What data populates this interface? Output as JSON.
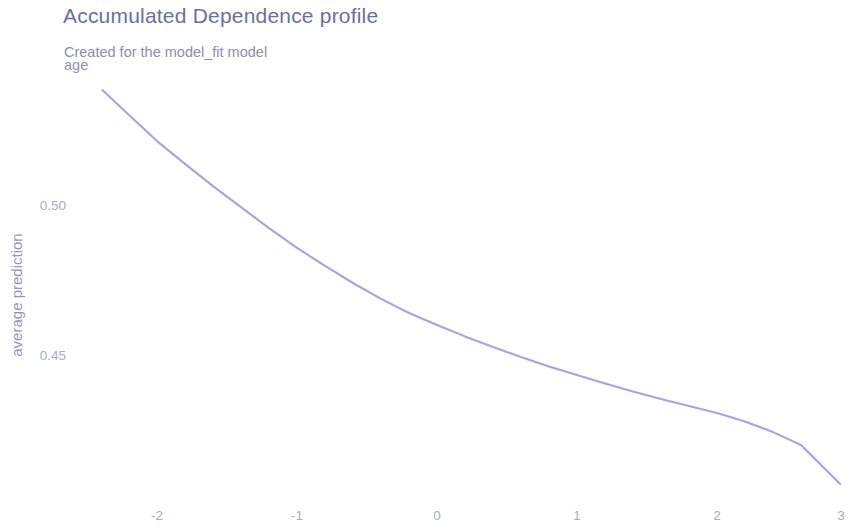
{
  "header": {
    "title": "Accumulated Dependence profile",
    "subtitle": "Created for the model_fit model",
    "facet_label": "age"
  },
  "colors": {
    "title": "#6b6f9e",
    "subtitle": "#8a8fa8",
    "line": "#9a9fd8",
    "tick": "#a9adc4",
    "axis_title": "#9397b8",
    "background": "#ffffff"
  },
  "axes": {
    "x": {
      "ticks": [
        "-2",
        "-1",
        "0",
        "1",
        "2",
        "3"
      ],
      "tick_values": [
        -2,
        -1,
        0,
        1,
        2,
        3
      ],
      "tick_px": [
        157,
        297,
        437,
        577,
        717,
        841
      ],
      "label": ""
    },
    "y": {
      "ticks": [
        "0.50",
        "0.45"
      ],
      "tick_values": [
        0.5,
        0.45
      ],
      "tick_px": [
        205,
        355
      ],
      "label": "average prediction"
    }
  },
  "chart_data": {
    "type": "line",
    "title": "Accumulated Dependence profile",
    "subtitle": "Created for the model_fit model",
    "facet": "age",
    "xlabel": "",
    "ylabel": "average prediction",
    "xlim": [
      -2.45,
      2.95
    ],
    "ylim": [
      0.4045,
      0.5405
    ],
    "xticks": [
      -2,
      -1,
      0,
      1,
      2,
      3
    ],
    "yticks": [
      0.45,
      0.5
    ],
    "grid": false,
    "legend": null,
    "series": [
      {
        "name": "age",
        "color": "#9a9fd8",
        "x": [
          -2.39,
          -2.2,
          -2.0,
          -1.8,
          -1.6,
          -1.4,
          -1.2,
          -1.0,
          -0.8,
          -0.6,
          -0.4,
          -0.2,
          0.0,
          0.2,
          0.4,
          0.6,
          0.8,
          1.0,
          1.2,
          1.4,
          1.6,
          1.8,
          2.0,
          2.2,
          2.4,
          2.6,
          2.88
        ],
        "y": [
          0.5383,
          0.53,
          0.5213,
          0.5137,
          0.5063,
          0.4993,
          0.4923,
          0.4857,
          0.4797,
          0.474,
          0.4687,
          0.464,
          0.46,
          0.4562,
          0.4527,
          0.4493,
          0.4462,
          0.4433,
          0.4405,
          0.4378,
          0.4353,
          0.433,
          0.4307,
          0.4278,
          0.4243,
          0.42,
          0.407
        ]
      }
    ]
  }
}
